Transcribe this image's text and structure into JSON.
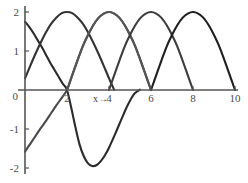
{
  "chart_data": {
    "type": "line",
    "title": "",
    "xlabel": "x→",
    "ylabel": "",
    "xlim": [
      0,
      10
    ],
    "ylim": [
      -2,
      2
    ],
    "grid": false,
    "legend": "none",
    "xticks": [
      2,
      4,
      6,
      8,
      10
    ],
    "xtick_labels": [
      "2",
      "4",
      "6",
      "8",
      "10"
    ],
    "yticks": [
      2,
      1,
      0,
      -1,
      -2
    ],
    "ytick_labels": [
      "2",
      "1",
      "0",
      "-1",
      "-2"
    ],
    "axis_origin_label": "0",
    "series": [
      {
        "name": "curve-1",
        "color": "#2b2b2b",
        "stroke_width": 2.1,
        "comment": "descending branch from (0,1.75) crossing zero at x=2, dipping to -1.95 near x=3.2, returning to 0 near x=5.6 then rising",
        "points": [
          [
            0.0,
            1.75
          ],
          [
            0.2,
            1.62
          ],
          [
            0.4,
            1.46
          ],
          [
            0.6,
            1.28
          ],
          [
            0.8,
            1.1
          ],
          [
            1.0,
            0.9
          ],
          [
            1.2,
            0.7
          ],
          [
            1.4,
            0.52
          ],
          [
            1.6,
            0.34
          ],
          [
            1.8,
            0.16
          ],
          [
            2.0,
            0.0
          ],
          [
            2.2,
            -0.45
          ],
          [
            2.4,
            -0.95
          ],
          [
            2.6,
            -1.4
          ],
          [
            2.8,
            -1.7
          ],
          [
            3.0,
            -1.88
          ],
          [
            3.2,
            -1.95
          ],
          [
            3.4,
            -1.93
          ],
          [
            3.6,
            -1.83
          ],
          [
            3.8,
            -1.68
          ],
          [
            4.0,
            -1.48
          ],
          [
            4.3,
            -1.12
          ],
          [
            4.6,
            -0.74
          ],
          [
            4.9,
            -0.38
          ],
          [
            5.2,
            -0.1
          ],
          [
            5.45,
            0.0
          ],
          [
            5.45,
            0.0
          ]
        ]
      },
      {
        "name": "curve-2",
        "color": "#4a4a4a",
        "stroke_width": 2.1,
        "comment": "rising from (0,-1.58) to zero at x=2, then arch peaking 2.0 at x=4, back to zero at x=6",
        "points": [
          [
            0.0,
            -1.58
          ],
          [
            0.25,
            -1.38
          ],
          [
            0.5,
            -1.18
          ],
          [
            0.75,
            -0.98
          ],
          [
            1.0,
            -0.79
          ],
          [
            1.25,
            -0.59
          ],
          [
            1.5,
            -0.39
          ],
          [
            1.75,
            -0.2
          ],
          [
            2.0,
            0.0
          ],
          [
            2.25,
            0.38
          ],
          [
            2.5,
            0.76
          ],
          [
            2.75,
            1.12
          ],
          [
            3.0,
            1.41
          ],
          [
            3.25,
            1.66
          ],
          [
            3.5,
            1.85
          ],
          [
            3.75,
            1.96
          ],
          [
            4.0,
            2.0
          ],
          [
            4.25,
            1.96
          ],
          [
            4.5,
            1.85
          ],
          [
            4.75,
            1.66
          ],
          [
            5.0,
            1.41
          ],
          [
            5.25,
            1.12
          ],
          [
            5.5,
            0.76
          ],
          [
            5.75,
            0.38
          ],
          [
            6.0,
            0.0
          ]
        ]
      },
      {
        "name": "curve-3",
        "color": "#333333",
        "stroke_width": 2.1,
        "comment": "arch from x=0 rising branch, peak 2.0 at x=1, zero at x=2 then descends? rendered as left arch 0..4 peak at 2",
        "points": [
          [
            0.0,
            0.3
          ],
          [
            0.25,
            0.62
          ],
          [
            0.5,
            0.93
          ],
          [
            0.75,
            1.22
          ],
          [
            1.0,
            1.48
          ],
          [
            1.25,
            1.7
          ],
          [
            1.5,
            1.86
          ],
          [
            1.75,
            1.97
          ],
          [
            2.0,
            2.0
          ],
          [
            2.25,
            1.97
          ],
          [
            2.5,
            1.86
          ],
          [
            2.75,
            1.7
          ],
          [
            3.0,
            1.48
          ],
          [
            3.25,
            1.22
          ],
          [
            3.5,
            0.93
          ],
          [
            3.75,
            0.62
          ],
          [
            4.0,
            0.3
          ],
          [
            4.2,
            0.06
          ],
          [
            4.25,
            0.0
          ]
        ]
      },
      {
        "name": "curve-4",
        "color": "#555555",
        "stroke_width": 2.1,
        "comment": "arch zero at x=2, peak 2.0 at x=4, zero at x=6 (drawn mid grey)",
        "points": [
          [
            2.0,
            0.0
          ],
          [
            2.25,
            0.38
          ],
          [
            2.5,
            0.76
          ],
          [
            2.75,
            1.12
          ],
          [
            3.0,
            1.41
          ],
          [
            3.25,
            1.66
          ],
          [
            3.5,
            1.85
          ],
          [
            3.75,
            1.96
          ],
          [
            4.0,
            2.0
          ],
          [
            4.25,
            1.96
          ],
          [
            4.5,
            1.85
          ],
          [
            4.75,
            1.66
          ],
          [
            5.0,
            1.41
          ],
          [
            5.25,
            1.12
          ],
          [
            5.5,
            0.76
          ],
          [
            5.75,
            0.38
          ],
          [
            6.0,
            0.0
          ]
        ]
      },
      {
        "name": "curve-5",
        "color": "#3d3d3d",
        "stroke_width": 2.1,
        "comment": "arch zero at x=4, peak 2.0 at x=6, zero at x=8",
        "points": [
          [
            4.0,
            0.0
          ],
          [
            4.25,
            0.38
          ],
          [
            4.5,
            0.76
          ],
          [
            4.75,
            1.12
          ],
          [
            5.0,
            1.41
          ],
          [
            5.25,
            1.66
          ],
          [
            5.5,
            1.85
          ],
          [
            5.75,
            1.96
          ],
          [
            6.0,
            2.0
          ],
          [
            6.25,
            1.96
          ],
          [
            6.5,
            1.85
          ],
          [
            6.75,
            1.66
          ],
          [
            7.0,
            1.41
          ],
          [
            7.25,
            1.12
          ],
          [
            7.5,
            0.76
          ],
          [
            7.75,
            0.38
          ],
          [
            8.0,
            0.0
          ]
        ]
      },
      {
        "name": "curve-6",
        "color": "#1f1f1f",
        "stroke_width": 2.1,
        "comment": "arch zero at x=6, peak 2.0 at x=8, zero at x=10",
        "points": [
          [
            6.0,
            0.0
          ],
          [
            6.25,
            0.38
          ],
          [
            6.5,
            0.76
          ],
          [
            6.75,
            1.12
          ],
          [
            7.0,
            1.41
          ],
          [
            7.25,
            1.66
          ],
          [
            7.5,
            1.85
          ],
          [
            7.75,
            1.96
          ],
          [
            8.0,
            2.0
          ],
          [
            8.25,
            1.96
          ],
          [
            8.5,
            1.85
          ],
          [
            8.75,
            1.66
          ],
          [
            9.0,
            1.41
          ],
          [
            9.25,
            1.12
          ],
          [
            9.5,
            0.76
          ],
          [
            9.75,
            0.38
          ],
          [
            10.0,
            0.0
          ]
        ]
      }
    ]
  }
}
